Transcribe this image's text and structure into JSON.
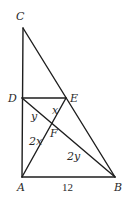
{
  "diagram": {
    "points": {
      "C": {
        "label": "C",
        "x": 23,
        "y": 28
      },
      "D": {
        "label": "D",
        "x": 22,
        "y": 98
      },
      "E": {
        "label": "E",
        "x": 66,
        "y": 98
      },
      "A": {
        "label": "A",
        "x": 22,
        "y": 177
      },
      "B": {
        "label": "B",
        "x": 115,
        "y": 177
      },
      "F": {
        "label": "F",
        "x": 52,
        "y": 123
      }
    },
    "segments": [
      {
        "from": "C",
        "to": "A"
      },
      {
        "from": "C",
        "to": "B"
      },
      {
        "from": "D",
        "to": "E"
      },
      {
        "from": "D",
        "to": "B"
      },
      {
        "from": "A",
        "to": "E"
      },
      {
        "from": "A",
        "to": "B"
      }
    ],
    "segment_labels": {
      "EF": "x",
      "DF": "y",
      "AF": "2x",
      "BF": "2y",
      "AB": "12"
    }
  }
}
